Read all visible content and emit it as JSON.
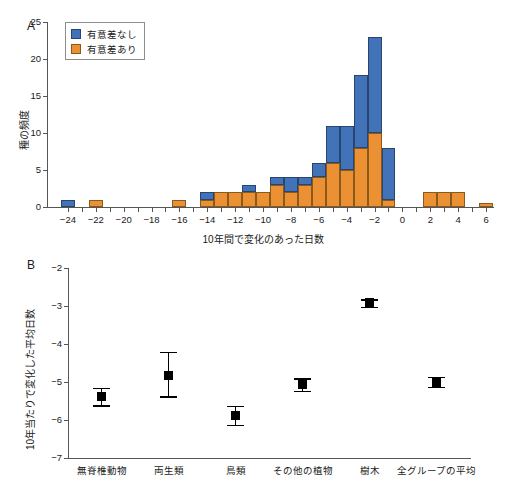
{
  "figure": {
    "panels": [
      {
        "letter": "A"
      },
      {
        "letter": "B"
      }
    ]
  },
  "chart_data": [
    {
      "type": "bar",
      "panel": "A",
      "title": "",
      "xlabel": "10年間で変化のあった日数",
      "ylabel": "種の頻度",
      "xlim": [
        -25,
        7
      ],
      "ylim": [
        0,
        25
      ],
      "grid": false,
      "stacked": true,
      "bar_width_days": 1,
      "legend_position": "top-left",
      "legend": [
        "有意差なし",
        "有意差あり"
      ],
      "colors": {
        "nosig": "#4273b8",
        "sig": "#eb9133"
      },
      "xticks": [
        -24,
        -22,
        -20,
        -18,
        -16,
        -14,
        -12,
        -10,
        -8,
        -6,
        -4,
        -2,
        0,
        2,
        4,
        6
      ],
      "xticklabels": [
        "−24",
        "−22",
        "−20",
        "−18",
        "−16",
        "−14",
        "−12",
        "−10",
        "−8",
        "−6",
        "−4",
        "−2",
        "0",
        "2",
        "4",
        "6"
      ],
      "yticks": [
        0,
        5,
        10,
        15,
        20,
        25
      ],
      "yticklabels": [
        "0",
        "5",
        "10",
        "15",
        "20",
        "25"
      ],
      "categories": [
        -24,
        -23,
        -22,
        -21,
        -20,
        -19,
        -18,
        -17,
        -16,
        -15,
        -14,
        -13,
        -12,
        -11,
        -10,
        -9,
        -8,
        -7,
        -6,
        -5,
        -4,
        -3,
        -2,
        -1,
        0,
        1,
        2,
        3,
        4,
        5,
        6
      ],
      "series": [
        {
          "name": "有意差あり",
          "values": [
            0,
            0,
            1,
            0,
            0,
            0,
            0,
            0,
            1,
            0,
            1,
            2,
            2,
            2,
            2,
            3,
            2,
            3,
            4,
            6,
            5,
            8,
            10,
            1,
            0,
            0,
            2,
            2,
            2,
            0,
            0.5
          ]
        },
        {
          "name": "有意差なし",
          "values": [
            1,
            0,
            0,
            0,
            0,
            0,
            0,
            0,
            0,
            0,
            1,
            0,
            0,
            1,
            0,
            1,
            2,
            1,
            2,
            5,
            6,
            9.8,
            13,
            7,
            0,
            0,
            0,
            0,
            0,
            0,
            0
          ]
        }
      ],
      "totals": [
        1,
        0,
        1,
        0,
        0,
        0,
        0,
        0,
        1,
        0,
        2,
        2,
        2,
        3,
        2,
        4,
        4,
        4,
        6,
        11,
        11,
        17.8,
        23,
        8,
        0,
        0,
        2,
        2,
        2,
        0,
        0.5
      ]
    },
    {
      "type": "scatter",
      "panel": "B",
      "title": "",
      "xlabel": "",
      "ylabel": "10年当たりで変化した平均日数",
      "ylim": [
        -7,
        -2
      ],
      "grid": false,
      "yticks": [
        -2,
        -3,
        -4,
        -5,
        -6,
        -7
      ],
      "yticklabels": [
        "−2",
        "−3",
        "−4",
        "−5",
        "−6",
        "−7"
      ],
      "categories": [
        "無脊椎動物",
        "両生類",
        "鳥類",
        "その他の植物",
        "樹木",
        "全グループの平均"
      ],
      "values": [
        -5.39,
        -4.82,
        -5.87,
        -5.07,
        -2.92,
        -5.01
      ],
      "err_low": [
        -5.61,
        -5.38,
        -6.13,
        -5.23,
        -3.02,
        -5.13
      ],
      "err_high": [
        -5.16,
        -4.21,
        -5.63,
        -4.9,
        -2.82,
        -4.87
      ],
      "marker": "square",
      "marker_color": "#000000"
    }
  ]
}
